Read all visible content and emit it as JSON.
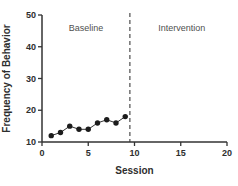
{
  "chart_data": {
    "type": "line",
    "title": "",
    "xlabel": "Session",
    "ylabel": "Frequency of Behavior",
    "x": [
      1,
      2,
      3,
      4,
      5,
      6,
      7,
      8,
      9
    ],
    "series": [
      {
        "name": "Baseline frequency of behavior",
        "values": [
          12,
          13,
          15,
          14,
          14,
          16,
          17,
          16,
          18
        ]
      }
    ],
    "xlim": [
      0,
      20
    ],
    "ylim": [
      10,
      50
    ],
    "xticks": [
      0,
      5,
      10,
      15,
      20
    ],
    "yticks": [
      10,
      20,
      30,
      40,
      50
    ],
    "grid": false,
    "legend": false,
    "marker": "filled-circle",
    "phase_divider": {
      "x": 9.5,
      "style": "dashed-vertical-line"
    },
    "annotations": [
      {
        "text": "Baseline",
        "x": 4.75,
        "y": 46
      },
      {
        "text": "Intervention",
        "x": 15.1,
        "y": 46
      }
    ],
    "colors": {
      "axis": "#333333",
      "line": "#333333",
      "marker": "#1c1c1c",
      "tick_text": "#2e2e2e",
      "phase_divider": "#5a5a5a",
      "annotation_text": "#4f4f4f",
      "background": "#ffffff"
    }
  }
}
